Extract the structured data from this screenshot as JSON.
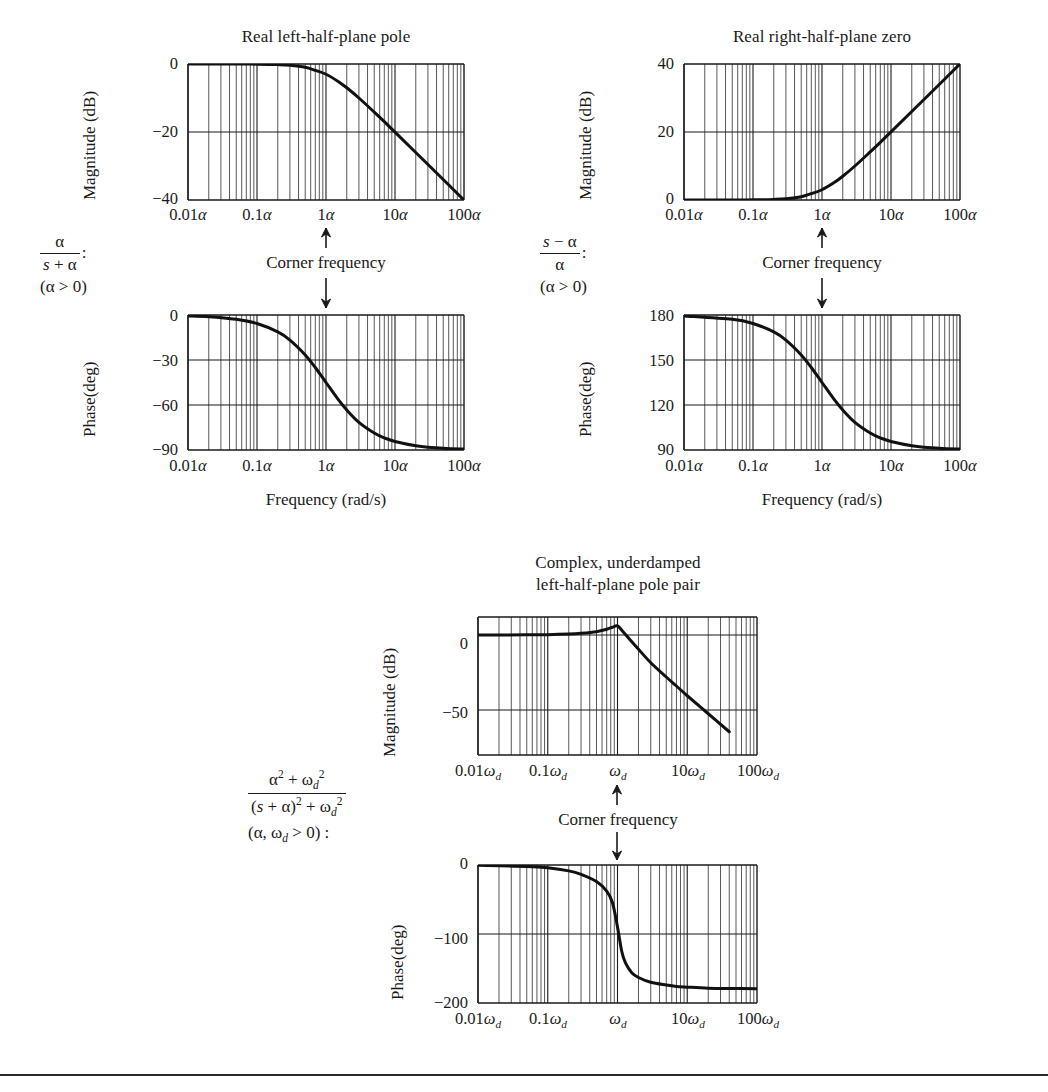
{
  "figure": {
    "background": "#ffffff",
    "ink": "#1a1a1a",
    "curve_color": "#111111",
    "grid_color": "#3a3a3a"
  },
  "panels": {
    "left": {
      "title": "Real left-half-plane pole",
      "formula": {
        "numerator": "α",
        "denominator": "s + α",
        "colon": ":",
        "condition": "(α > 0)"
      },
      "magnitude": {
        "ylabel": "Magnitude (dB)",
        "yticks": [
          "0",
          "−20",
          "−40"
        ],
        "xticks": [
          "0.01α",
          "0.1α",
          "1α",
          "10α",
          "100α"
        ]
      },
      "phase": {
        "ylabel": "Phase(deg)",
        "yticks": [
          "0",
          "−30",
          "−60",
          "−90"
        ],
        "xticks": [
          "0.01α",
          "0.1α",
          "1α",
          "10α",
          "100α"
        ]
      },
      "xlabel": "Frequency (rad/s)",
      "annotation": "Corner frequency"
    },
    "right": {
      "title": "Real right-half-plane zero",
      "formula": {
        "numerator": "s − α",
        "denominator": "α",
        "colon": ":",
        "condition": "(α > 0)"
      },
      "magnitude": {
        "ylabel": "Magnitude (dB)",
        "yticks": [
          "40",
          "20",
          "0"
        ],
        "xticks": [
          "0.01α",
          "0.1α",
          "1α",
          "10α",
          "100α"
        ]
      },
      "phase": {
        "ylabel": "Phase(deg)",
        "yticks": [
          "180",
          "150",
          "120",
          "90"
        ],
        "xticks": [
          "0.01α",
          "0.1α",
          "1α",
          "10α",
          "100α"
        ]
      },
      "xlabel": "Frequency (rad/s)",
      "annotation": "Corner frequency"
    },
    "bottom": {
      "title_line1": "Complex, underdamped",
      "title_line2": "left-half-plane pole pair",
      "formula": {
        "numerator": "α² + ωₓ²",
        "denominator": "(s + α)² + ωₓ²",
        "condition": "(α, ωₓ > 0) :"
      },
      "magnitude": {
        "ylabel": "Magnitude (dB)",
        "yticks": [
          "0",
          "−50"
        ],
        "xticks": [
          "0.01ωₓ",
          "0.1ωₓ",
          "ωₓ",
          "10ωₓ",
          "100ωₓ"
        ]
      },
      "phase": {
        "ylabel": "Phase(deg)",
        "yticks": [
          "0",
          "−100",
          "−200"
        ],
        "xticks": [
          "0.01ωₓ",
          "0.1ωₓ",
          "ωₓ",
          "10ωₓ",
          "100ωₓ"
        ]
      },
      "annotation": "Corner frequency"
    }
  },
  "chart_data": [
    {
      "id": "left-magnitude",
      "type": "line",
      "title": "Real left-half-plane pole",
      "xlabel": "Frequency (rad/s)",
      "ylabel": "Magnitude (dB)",
      "xscale": "log",
      "xlim": [
        0.01,
        100
      ],
      "ylim": [
        -40,
        0
      ],
      "xticks": [
        0.01,
        0.1,
        1,
        10,
        100
      ],
      "xticklabels": [
        "0.01α",
        "0.1α",
        "1α",
        "10α",
        "100α"
      ],
      "yticks": [
        0,
        -20,
        -40
      ],
      "grid": true,
      "minor_grid": "log-decades",
      "series": [
        {
          "name": "20log10(1/|1+jw|)",
          "x": [
            0.01,
            0.02,
            0.05,
            0.1,
            0.2,
            0.3,
            0.5,
            0.7,
            1,
            1.5,
            2,
            3,
            5,
            7,
            10,
            20,
            50,
            100
          ],
          "y": [
            0.0,
            0.0,
            -0.01,
            -0.04,
            -0.17,
            -0.37,
            -0.97,
            -1.87,
            -3.01,
            -5.12,
            -6.99,
            -10.0,
            -14.15,
            -16.95,
            -20.04,
            -26.03,
            -33.98,
            -40.0
          ]
        }
      ]
    },
    {
      "id": "left-phase",
      "type": "line",
      "title": "",
      "xlabel": "Frequency (rad/s)",
      "ylabel": "Phase(deg)",
      "xscale": "log",
      "xlim": [
        0.01,
        100
      ],
      "ylim": [
        -90,
        0
      ],
      "xticks": [
        0.01,
        0.1,
        1,
        10,
        100
      ],
      "xticklabels": [
        "0.01α",
        "0.1α",
        "1α",
        "10α",
        "100α"
      ],
      "yticks": [
        0,
        -30,
        -60,
        -90
      ],
      "grid": true,
      "series": [
        {
          "name": "-atan(w)",
          "x": [
            0.01,
            0.02,
            0.05,
            0.1,
            0.2,
            0.3,
            0.5,
            0.7,
            1,
            1.5,
            2,
            3,
            5,
            7,
            10,
            20,
            50,
            100
          ],
          "y": [
            -0.6,
            -1.1,
            -2.9,
            -5.7,
            -11.3,
            -16.7,
            -26.6,
            -35.0,
            -45.0,
            -56.3,
            -63.4,
            -71.6,
            -78.7,
            -81.9,
            -84.3,
            -87.1,
            -88.9,
            -89.4
          ]
        }
      ]
    },
    {
      "id": "right-magnitude",
      "type": "line",
      "title": "Real right-half-plane zero",
      "xlabel": "Frequency (rad/s)",
      "ylabel": "Magnitude (dB)",
      "xscale": "log",
      "xlim": [
        0.01,
        100
      ],
      "ylim": [
        0,
        40
      ],
      "xticks": [
        0.01,
        0.1,
        1,
        10,
        100
      ],
      "xticklabels": [
        "0.01α",
        "0.1α",
        "1α",
        "10α",
        "100α"
      ],
      "yticks": [
        40,
        20,
        0
      ],
      "grid": true,
      "series": [
        {
          "name": "20log10|1-jw|",
          "x": [
            0.01,
            0.05,
            0.1,
            0.2,
            0.3,
            0.5,
            0.7,
            1,
            1.5,
            2,
            3,
            5,
            7,
            10,
            20,
            50,
            100
          ],
          "y": [
            0.0,
            0.01,
            0.04,
            0.17,
            0.37,
            0.97,
            1.87,
            3.01,
            5.12,
            6.99,
            10.0,
            14.15,
            16.95,
            20.04,
            26.03,
            33.98,
            40.0
          ]
        }
      ]
    },
    {
      "id": "right-phase",
      "type": "line",
      "title": "",
      "xlabel": "Frequency (rad/s)",
      "ylabel": "Phase(deg)",
      "xscale": "log",
      "xlim": [
        0.01,
        100
      ],
      "ylim": [
        90,
        180
      ],
      "xticks": [
        0.01,
        0.1,
        1,
        10,
        100
      ],
      "xticklabels": [
        "0.01α",
        "0.1α",
        "1α",
        "10α",
        "100α"
      ],
      "yticks": [
        180,
        150,
        120,
        90
      ],
      "grid": true,
      "series": [
        {
          "name": "180 - atan(w)",
          "x": [
            0.01,
            0.05,
            0.1,
            0.2,
            0.3,
            0.5,
            0.7,
            1,
            1.5,
            2,
            3,
            5,
            7,
            10,
            20,
            50,
            100
          ],
          "y": [
            179.4,
            177.1,
            174.3,
            168.7,
            163.3,
            153.4,
            145.0,
            135.0,
            123.7,
            116.6,
            108.4,
            101.3,
            98.1,
            95.7,
            92.9,
            91.1,
            90.6
          ]
        }
      ]
    },
    {
      "id": "bottom-magnitude",
      "type": "line",
      "title": "Complex, underdamped left-half-plane pole pair",
      "xlabel": "",
      "ylabel": "Magnitude (dB)",
      "xscale": "log",
      "xlim": [
        0.01,
        100
      ],
      "ylim": [
        -80,
        12
      ],
      "xticks": [
        0.01,
        0.1,
        1,
        10,
        100
      ],
      "xticklabels": [
        "0.01ωd",
        "0.1ωd",
        "ωd",
        "10ωd",
        "100ωd"
      ],
      "yticks": [
        0,
        -50
      ],
      "grid": true,
      "peak_db": 6,
      "series": [
        {
          "name": "second-order underdamped magnitude",
          "x": [
            0.01,
            0.05,
            0.1,
            0.2,
            0.3,
            0.5,
            0.7,
            0.85,
            1.0,
            1.2,
            1.5,
            2,
            3,
            5,
            7,
            10,
            20,
            40
          ],
          "y": [
            0.0,
            0.1,
            0.2,
            0.6,
            1.1,
            2.2,
            3.8,
            5.2,
            6.1,
            2.2,
            -3.0,
            -9.5,
            -18.5,
            -28.0,
            -34.0,
            -40.5,
            -52.5,
            -64.5
          ]
        }
      ]
    },
    {
      "id": "bottom-phase",
      "type": "line",
      "title": "",
      "xlabel": "",
      "ylabel": "Phase(deg)",
      "xscale": "log",
      "xlim": [
        0.01,
        100
      ],
      "ylim": [
        -200,
        0
      ],
      "xticks": [
        0.01,
        0.1,
        1,
        10,
        100
      ],
      "xticklabels": [
        "0.01ωd",
        "0.1ωd",
        "ωd",
        "10ωd",
        "100ωd"
      ],
      "yticks": [
        0,
        -100,
        -200
      ],
      "grid": true,
      "series": [
        {
          "name": "second-order underdamped phase",
          "x": [
            0.01,
            0.05,
            0.1,
            0.2,
            0.3,
            0.5,
            0.7,
            0.85,
            1.0,
            1.15,
            1.3,
            1.6,
            2,
            3,
            5,
            7,
            10,
            20,
            50,
            100
          ],
          "y": [
            -0.5,
            -2.0,
            -4.0,
            -8.5,
            -13.5,
            -24.0,
            -38.0,
            -55.0,
            -90.0,
            -125.0,
            -142.0,
            -156.0,
            -163.0,
            -170.0,
            -174.0,
            -176.0,
            -177.0,
            -178.5,
            -179.0,
            -179.4
          ]
        }
      ]
    }
  ]
}
